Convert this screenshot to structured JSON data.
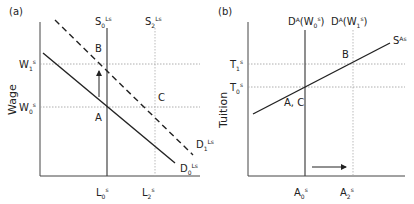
{
  "panel_a": {
    "tag": "(a)",
    "y_axis_title": "Wage",
    "supply_s0": {
      "base": "S",
      "sub": "0",
      "sup": "Ls"
    },
    "supply_s2": {
      "base": "S",
      "sub": "2",
      "sup": "Ls"
    },
    "wage_w1": {
      "base": "W",
      "sub": "1",
      "sup": "s"
    },
    "wage_w0": {
      "base": "W",
      "sub": "0",
      "sup": "s"
    },
    "demand_d0": {
      "base": "D",
      "sub": "0",
      "sup": "Ls"
    },
    "demand_d1": {
      "base": "D",
      "sub": "1",
      "sup": "Ls"
    },
    "qty_l0": {
      "base": "L",
      "sub": "0",
      "sup": "s"
    },
    "qty_l2": {
      "base": "L",
      "sub": "2",
      "sup": "s"
    },
    "point_a": "A",
    "point_b": "B",
    "point_c": "C"
  },
  "panel_b": {
    "tag": "(b)",
    "y_axis_title": "Tuition",
    "demand_w0": {
      "pre": "D",
      "sup1": "A",
      "mid": "(W",
      "sub": "0",
      "sup": "s",
      "post": ")"
    },
    "demand_w1": {
      "pre": "D",
      "sup1": "A",
      "mid": "(W",
      "sub": "1",
      "sup": "s",
      "post": ")"
    },
    "supply": {
      "base": "S",
      "sup": "As"
    },
    "tuition_t1": {
      "base": "T",
      "sub": "1",
      "sup": "s"
    },
    "tuition_t0": {
      "base": "T",
      "sub": "0",
      "sup": "s"
    },
    "qty_a0": {
      "base": "A",
      "sub": "0",
      "sup": "s"
    },
    "qty_a2": {
      "base": "A",
      "sub": "2",
      "sup": "s"
    },
    "point_ac": "A, C",
    "point_b": "B"
  },
  "colors": {
    "line": "#222222",
    "guide": "#999999"
  }
}
